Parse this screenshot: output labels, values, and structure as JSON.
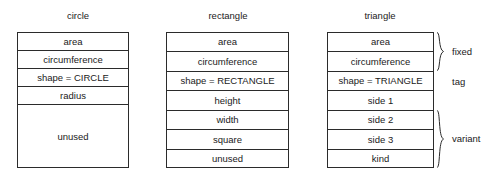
{
  "diagram": {
    "kind": "memory-layout-comparison",
    "columns": [
      {
        "id": "circle",
        "title": "circle",
        "title_left": 47,
        "title_width": 62,
        "title_top": 10,
        "table_left": 17,
        "table_top": 32,
        "table_width": 112,
        "table_height": 136,
        "rows": [
          {
            "label": "area",
            "height": 18
          },
          {
            "label": "circumference",
            "height": 18
          },
          {
            "label": "shape = CIRCLE",
            "height": 18
          },
          {
            "label": "radius",
            "height": 18
          },
          {
            "label": "unused",
            "height": 64
          }
        ]
      },
      {
        "id": "rectangle",
        "title": "rectangle",
        "title_left": 197,
        "title_width": 62,
        "title_top": 10,
        "table_left": 166,
        "table_top": 32,
        "table_width": 123,
        "table_height": 136,
        "rows": [
          {
            "label": "area",
            "height": 19.43
          },
          {
            "label": "circumference",
            "height": 19.43
          },
          {
            "label": "shape = RECTANGLE",
            "height": 19.43
          },
          {
            "label": "height",
            "height": 19.43
          },
          {
            "label": "width",
            "height": 19.43
          },
          {
            "label": "square",
            "height": 19.43
          },
          {
            "label": "unused",
            "height": 19.43
          }
        ]
      },
      {
        "id": "triangle",
        "title": "triangle",
        "title_left": 349,
        "title_width": 62,
        "title_top": 10,
        "table_left": 327,
        "table_top": 32,
        "table_width": 107,
        "table_height": 136,
        "rows": [
          {
            "label": "area",
            "height": 19.43
          },
          {
            "label": "circumference",
            "height": 19.43
          },
          {
            "label": "shape = TRIANGLE",
            "height": 19.43
          },
          {
            "label": "side 1",
            "height": 19.43
          },
          {
            "label": "side 2",
            "height": 19.43
          },
          {
            "label": "side 3",
            "height": 19.43
          },
          {
            "label": "kind",
            "height": 19.43
          }
        ]
      }
    ],
    "annotations": [
      {
        "id": "fixed",
        "label": "fixed",
        "brace_left": 436,
        "brace_top": 32,
        "brace_height": 39,
        "label_left": 452,
        "label_top": 46
      },
      {
        "id": "tag",
        "label": "tag",
        "brace_left": null,
        "brace_top": null,
        "brace_height": 0,
        "label_left": 452,
        "label_top": 76
      },
      {
        "id": "variant",
        "label": "variant",
        "brace_left": 436,
        "brace_top": 110,
        "brace_height": 58,
        "label_left": 452,
        "label_top": 133
      }
    ]
  },
  "colors": {
    "background": "#ffffff",
    "stroke": "#2b2b2b",
    "text": "#1a1a1a"
  }
}
